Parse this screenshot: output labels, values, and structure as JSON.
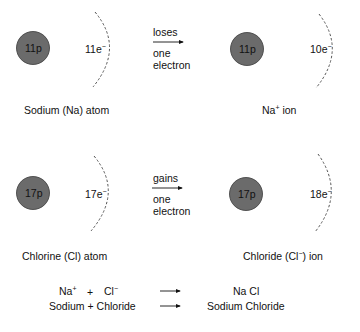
{
  "row1": {
    "left_atom": {
      "nucleus": "11p",
      "electrons": "11e",
      "electron_charge": "−",
      "label": "Sodium (Na) atom"
    },
    "transfer": {
      "verb": "loses",
      "line1": "one",
      "line2": "electron"
    },
    "right_ion": {
      "nucleus": "11p",
      "electrons": "10e",
      "electron_charge": "−",
      "label_base": "Na",
      "label_charge": "+",
      "label_suffix": " ion"
    }
  },
  "row2": {
    "left_atom": {
      "nucleus": "17p",
      "electrons": "17e",
      "electron_charge": "−",
      "label": "Chlorine (Cl) atom"
    },
    "transfer": {
      "verb": "gains",
      "line1": "one",
      "line2": "electron"
    },
    "right_ion": {
      "nucleus": "17p",
      "electrons": "18e",
      "electron_charge": "−",
      "label_prefix": "Chloride (Cl",
      "label_charge": "−",
      "label_suffix": ") ion"
    }
  },
  "equations": [
    {
      "lhs_a": "Na",
      "lhs_a_charge": "+",
      "plus": "+",
      "lhs_b": "Cl",
      "lhs_b_charge": "−",
      "rhs": "Na Cl"
    },
    {
      "lhs": "Sodium + Chloride",
      "rhs": "Sodium Chloride"
    }
  ],
  "colors": {
    "nucleus_fill": "#6b6b6b",
    "nucleus_stroke": "#3a3a3a",
    "shell": "#555555",
    "text": "#111111"
  }
}
